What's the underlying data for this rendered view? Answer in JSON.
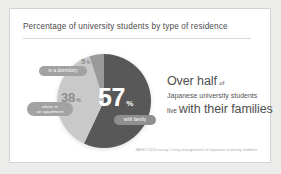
{
  "card": {
    "title": "Percentage of university students by type of residence",
    "source": "JASSO 2021 survey: Living arrangements of Japanese university students"
  },
  "chart_data": {
    "type": "pie",
    "title": "Percentage of university students by type of residence",
    "categories": [
      "with family",
      "alone in an apartment",
      "in a dormitory"
    ],
    "values": [
      57,
      38,
      5
    ],
    "unit": "%",
    "colors": [
      "#585858",
      "#c9c9c9",
      "#9a9a9a"
    ],
    "legend": "inline-labels",
    "grid": false,
    "slices": [
      {
        "label": "with family",
        "value": 57,
        "value_text": "57",
        "percent_symbol": "%",
        "color": "#585858",
        "badge_lines": [
          "with family"
        ]
      },
      {
        "label": "alone in an apartment",
        "value": 38,
        "value_text": "38",
        "percent_symbol": "%",
        "color": "#c9c9c9",
        "badge_lines": [
          "alone in",
          "an apartment"
        ]
      },
      {
        "label": "in a dormitory",
        "value": 5,
        "value_text": "5",
        "percent_symbol": "%",
        "color": "#9a9a9a",
        "badge_lines": [
          "in a dormitory"
        ]
      }
    ]
  },
  "headline": {
    "line1_big": "Over half",
    "line1_small": "of",
    "line2": "Japanese university students",
    "line3_small": "live",
    "line3_big": "with their families"
  }
}
